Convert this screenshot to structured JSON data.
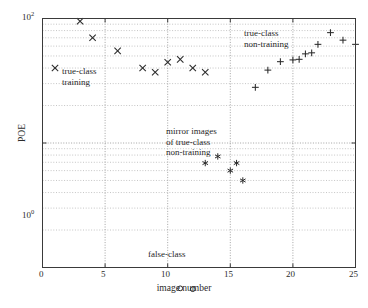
{
  "chart_data": {
    "type": "scatter",
    "title": "",
    "xlabel": "image number",
    "ylabel": "POE",
    "xlim": [
      0,
      25
    ],
    "ylim": [
      1,
      100
    ],
    "yscale": "log",
    "xscale": "linear",
    "grid": true,
    "legend_position": "inline-annotations",
    "xticks": [
      0,
      5,
      10,
      15,
      20,
      25
    ],
    "xtick_labels": [
      "0",
      "5",
      "10",
      "15",
      "20",
      "25"
    ],
    "yticks": [
      1,
      100
    ],
    "ytick_labels": [
      "10^0",
      "10^2"
    ],
    "ytick_label_bases": [
      "10",
      "10"
    ],
    "ytick_label_exponents": [
      "0",
      "2"
    ],
    "series": [
      {
        "name": "true-class training",
        "marker": "x",
        "x": [
          1,
          3,
          4,
          6,
          8,
          9,
          10,
          11,
          12,
          13
        ],
        "y": [
          40.0,
          95.0,
          70.0,
          55.0,
          40.0,
          37.0,
          44.5,
          47.0,
          40.0,
          37.0
        ]
      },
      {
        "name": "true-class non-training",
        "marker": "+",
        "x": [
          17,
          18,
          19,
          20,
          20.5,
          21,
          21.5,
          22,
          23,
          24,
          25
        ],
        "y": [
          28.0,
          38.5,
          45.0,
          46.5,
          47.0,
          52.0,
          53.0,
          62.0,
          77.0,
          67.0,
          62.0
        ]
      },
      {
        "name": "mirror images of true-class non-training",
        "marker": "*",
        "x": [
          13,
          14,
          15,
          15.5,
          16
        ],
        "y": [
          6.9,
          7.8,
          6.0,
          6.9,
          5.0
        ]
      },
      {
        "name": "false-class",
        "marker": "o",
        "x": [
          11,
          12
        ],
        "y": [
          0.68,
          0.67
        ]
      }
    ],
    "annotations": [
      {
        "text_lines": [
          "true-class",
          "training"
        ],
        "x_px": 62,
        "y_px": 68
      },
      {
        "text_lines": [
          "true-class",
          "non-training"
        ],
        "x_px": 243,
        "y_px": 30
      },
      {
        "text_lines": [
          "mirror images",
          "of true-class",
          "non-training"
        ],
        "x_px": 167,
        "y_px": 128
      },
      {
        "text_lines": [
          "false-class"
        ],
        "x_px": 147,
        "y_px": 251
      }
    ]
  },
  "axis": {
    "x_title": "image number",
    "y_title": "POE",
    "x_tick_0": "0",
    "x_tick_1": "5",
    "x_tick_2": "10",
    "x_tick_3": "15",
    "x_tick_4": "20",
    "x_tick_5": "25",
    "y_tick_top_base": "10",
    "y_tick_top_exp": "2",
    "y_tick_bottom_base": "10",
    "y_tick_bottom_exp": "0"
  },
  "annotations": {
    "true_class_training_l1": "true-class",
    "true_class_training_l2": "training",
    "true_class_nontraining_l1": "true-class",
    "true_class_nontraining_l2": "non-training",
    "mirror_l1": "mirror images",
    "mirror_l2": "of true-class",
    "mirror_l3": "non-training",
    "false_class": "false-class"
  },
  "colors": {
    "marker": "#2b2b2b",
    "frame": "#3a3a3a",
    "grid": "#8c8c8c",
    "background": "#ffffff"
  }
}
